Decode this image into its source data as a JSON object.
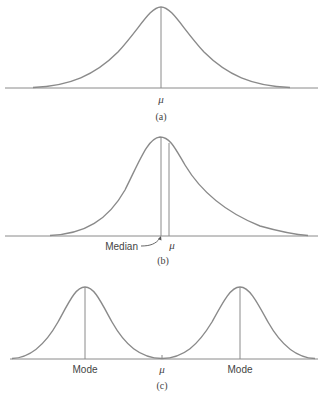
{
  "figure": {
    "panels": [
      {
        "id": "a",
        "caption": "(a)",
        "description": "Symmetric unimodal distribution",
        "labels": {
          "mean": "μ"
        }
      },
      {
        "id": "b",
        "caption": "(b)",
        "description": "Right-skewed distribution",
        "labels": {
          "median": "Median",
          "mean": "μ"
        }
      },
      {
        "id": "c",
        "caption": "(c)",
        "description": "Bimodal distribution",
        "labels": {
          "mode_left": "Mode",
          "mean": "μ",
          "mode_right": "Mode"
        }
      }
    ]
  },
  "colors": {
    "line": "#8a8a8a",
    "text": "#444444",
    "background": "#ffffff"
  }
}
